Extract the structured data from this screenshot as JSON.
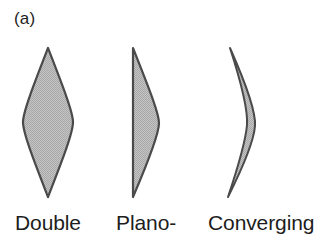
{
  "figure": {
    "panel_label": "(a)",
    "background_color": "#ffffff",
    "width": 319,
    "height": 238
  },
  "style": {
    "lens_outline_color": "#4a4a4a",
    "lens_fill_color": "#b8b8b8",
    "lens_outline_width": 2.2,
    "text_color": "#1d1d1d"
  },
  "lenses": [
    {
      "id": "double-convex",
      "label": "Double",
      "type": "biconvex",
      "description": "double convex lens, both surfaces curved outward, pointed top and bottom apexes",
      "bounds": {
        "left": 23,
        "right": 73,
        "top": 48,
        "bottom": 197
      },
      "axis_x": 48,
      "max_thickness": 50,
      "path": "M 48 48 C 62 84 73 112 73 122 C 73 133 62 161 48 197 C 34 161 23 133 23 122 C 23 112 34 84 48 48 Z"
    },
    {
      "id": "plano-convex",
      "label": "Plano-",
      "type": "plano-convex",
      "description": "plano convex lens, flat left face, convex right face",
      "bounds": {
        "left": 133,
        "right": 159,
        "top": 48,
        "bottom": 197
      },
      "flat_edge_x": 133,
      "max_thickness": 26,
      "path": "M 133 48 C 148 86 159 113 159 123 C 159 134 148 162 133 197 Z"
    },
    {
      "id": "meniscus-converging",
      "label": "Converging",
      "type": "positive-meniscus",
      "description": "converging meniscus lens, crescent shaped, concave left face and convex right face",
      "bounds": {
        "left": 228,
        "right": 256,
        "top": 48,
        "bottom": 197
      },
      "max_thickness": 15,
      "path": "M 230 48 C 246 84 256 114 255 126 C 254 139 243 167 228 197 C 239 164 246 137 247 125 C 248 111 241 82 230 48 Z"
    }
  ],
  "captions": [
    {
      "id": "caption-double",
      "text": "Double"
    },
    {
      "id": "caption-plano",
      "text": "Plano-"
    },
    {
      "id": "caption-converging",
      "text": "Converging"
    }
  ]
}
